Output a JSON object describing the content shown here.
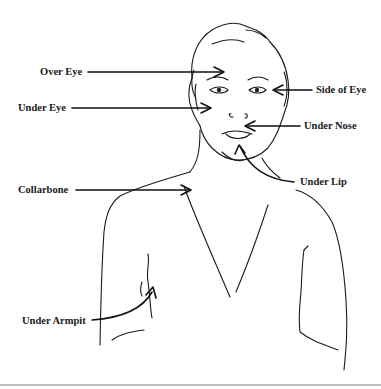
{
  "figure": {
    "points": [
      {
        "id": "over-eye",
        "label": "Over Eye",
        "x": 40,
        "y": 66
      },
      {
        "id": "under-eye",
        "label": "Under Eye",
        "x": 18,
        "y": 102
      },
      {
        "id": "side-of-eye",
        "label": "Side of Eye",
        "x": 316,
        "y": 84
      },
      {
        "id": "under-nose",
        "label": "Under Nose",
        "x": 304,
        "y": 120
      },
      {
        "id": "under-lip",
        "label": "Under Lip",
        "x": 300,
        "y": 176
      },
      {
        "id": "collarbone",
        "label": "Collarbone",
        "x": 18,
        "y": 184
      },
      {
        "id": "under-armpit",
        "label": "Under Armpit",
        "x": 22,
        "y": 315
      }
    ]
  }
}
